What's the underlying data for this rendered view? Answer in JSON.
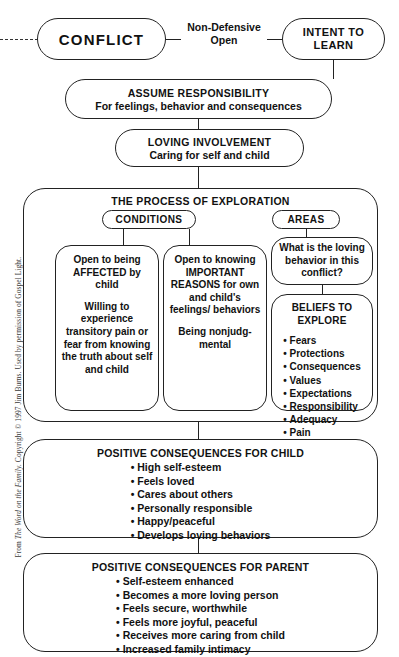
{
  "diagram": {
    "credit_prefix": "From ",
    "credit_italic": "The Word on the Family.",
    "credit_suffix": " Copyright © 1997 Jim Burns. Used by permission of Gospel Light.",
    "line_color": "#222222"
  },
  "nodes": {
    "conflict": {
      "title": "CONFLICT"
    },
    "intent": {
      "title": "INTENT TO LEARN"
    },
    "edge_conflict_intent": {
      "line1": "Non-Defensive",
      "line2": "Open"
    },
    "assume": {
      "title": "ASSUME RESPONSIBILITY",
      "subtitle": "For feelings, behavior and consequences"
    },
    "loving": {
      "title": "LOVING INVOLVEMENT",
      "subtitle": "Caring for self and child"
    },
    "process": {
      "title": "THE PROCESS OF EXPLORATION"
    },
    "conditions": {
      "title": "CONDITIONS"
    },
    "areas": {
      "title": "AREAS"
    },
    "condition_one": {
      "para1": "Open to being AFFECTED by child",
      "para2": "Willing to experience transitory pain or fear from knowing the truth about self and child"
    },
    "condition_two": {
      "para1": "Open to knowing IMPORTANT REASONS for own and child's feelings/ behaviors",
      "para2": "Being nonjudg- mental"
    },
    "areas_question": {
      "text": "What is the loving behavior in this conflict?"
    },
    "beliefs": {
      "title": "BELIEFS TO EXPLORE",
      "items": [
        "Fears",
        "Protections",
        "Consequences",
        "Values",
        "Expectations",
        "Responsibility",
        "Adequacy",
        "Pain"
      ]
    },
    "child_outcomes": {
      "title": "POSITIVE CONSEQUENCES FOR CHILD",
      "items": [
        "High self-esteem",
        "Feels loved",
        "Cares about others",
        "Personally responsible",
        "Happy/peaceful",
        "Develops loving behaviors"
      ]
    },
    "parent_outcomes": {
      "title": "POSITIVE CONSEQUENCES FOR PARENT",
      "items": [
        "Self-esteem enhanced",
        "Becomes a more loving person",
        "Feels secure, worthwhile",
        "Feels more joyful, peaceful",
        "Receives more caring from child",
        "Increased family intimacy"
      ]
    }
  }
}
